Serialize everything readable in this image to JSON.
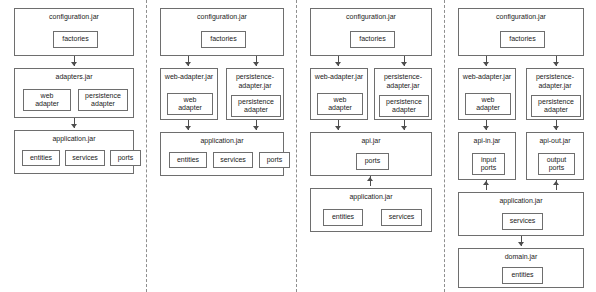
{
  "diagram": {
    "background_color": "#ffffff",
    "box_border_color": "#6e6e6e",
    "arrow_color": "#4d4d4d",
    "separator_color": "#8f8f8f",
    "separator_style": "dashed-vertical",
    "separator_count": 3
  },
  "columns": [
    {
      "id": "col-1",
      "name": "single-adapters-jar-variant",
      "jars": [
        {
          "id": "c1-configuration",
          "title": "configuration.jar",
          "components": [
            {
              "id": "c1-factories",
              "label": "factories"
            }
          ]
        },
        {
          "id": "c1-adapters",
          "title": "adapters.jar",
          "components": [
            {
              "id": "c1-web-adapter",
              "label": "web\nadapter"
            },
            {
              "id": "c1-persistence-adapter",
              "label": "persistence\nadapter"
            }
          ]
        },
        {
          "id": "c1-application",
          "title": "application.jar",
          "components": [
            {
              "id": "c1-entities",
              "label": "entities"
            },
            {
              "id": "c1-services",
              "label": "services"
            },
            {
              "id": "c1-ports",
              "label": "ports"
            }
          ]
        }
      ],
      "arrows": [
        {
          "id": "c1-a1",
          "from": "c1-configuration",
          "to": "c1-adapters",
          "direction": "down"
        },
        {
          "id": "c1-a2",
          "from": "c1-adapters",
          "to": "c1-application",
          "direction": "down"
        }
      ]
    },
    {
      "id": "col-2",
      "name": "split-adapter-jars-variant",
      "jars": [
        {
          "id": "c2-configuration",
          "title": "configuration.jar",
          "components": [
            {
              "id": "c2-factories",
              "label": "factories"
            }
          ]
        },
        {
          "id": "c2-web-adapter-jar",
          "title": "web-adapter.jar",
          "components": [
            {
              "id": "c2-web-adapter",
              "label": "web\nadapter"
            }
          ]
        },
        {
          "id": "c2-persistence-adapter-jar",
          "title": "persistence-\nadapter.jar",
          "components": [
            {
              "id": "c2-persistence-adapter",
              "label": "persistence\nadapter"
            }
          ]
        },
        {
          "id": "c2-application",
          "title": "application.jar",
          "components": [
            {
              "id": "c2-entities",
              "label": "entities"
            },
            {
              "id": "c2-services",
              "label": "services"
            },
            {
              "id": "c2-ports",
              "label": "ports"
            }
          ]
        }
      ],
      "arrows": [
        {
          "id": "c2-a1",
          "from": "c2-configuration",
          "to": "c2-web-adapter-jar",
          "direction": "down"
        },
        {
          "id": "c2-a2",
          "from": "c2-configuration",
          "to": "c2-persistence-adapter-jar",
          "direction": "down"
        },
        {
          "id": "c2-a3",
          "from": "c2-web-adapter-jar",
          "to": "c2-application",
          "direction": "down"
        },
        {
          "id": "c2-a4",
          "from": "c2-persistence-adapter-jar",
          "to": "c2-application",
          "direction": "down"
        }
      ]
    },
    {
      "id": "col-3",
      "name": "separate-api-jar-variant",
      "jars": [
        {
          "id": "c3-configuration",
          "title": "configuration.jar",
          "components": [
            {
              "id": "c3-factories",
              "label": "factories"
            }
          ]
        },
        {
          "id": "c3-web-adapter-jar",
          "title": "web-adapter.jar",
          "components": [
            {
              "id": "c3-web-adapter",
              "label": "web\nadapter"
            }
          ]
        },
        {
          "id": "c3-persistence-adapter-jar",
          "title": "persistence-\nadapter.jar",
          "components": [
            {
              "id": "c3-persistence-adapter",
              "label": "persistence\nadapter"
            }
          ]
        },
        {
          "id": "c3-api",
          "title": "api.jar",
          "components": [
            {
              "id": "c3-ports",
              "label": "ports"
            }
          ]
        },
        {
          "id": "c3-application",
          "title": "application.jar",
          "components": [
            {
              "id": "c3-entities",
              "label": "entities"
            },
            {
              "id": "c3-services",
              "label": "services"
            }
          ]
        }
      ],
      "arrows": [
        {
          "id": "c3-a1",
          "from": "c3-configuration",
          "to": "c3-web-adapter-jar",
          "direction": "down"
        },
        {
          "id": "c3-a2",
          "from": "c3-configuration",
          "to": "c3-persistence-adapter-jar",
          "direction": "down"
        },
        {
          "id": "c3-a3",
          "from": "c3-web-adapter-jar",
          "to": "c3-api",
          "direction": "down"
        },
        {
          "id": "c3-a4",
          "from": "c3-persistence-adapter-jar",
          "to": "c3-api",
          "direction": "down"
        },
        {
          "id": "c3-a5",
          "from": "c3-application",
          "to": "c3-api",
          "direction": "up"
        }
      ]
    },
    {
      "id": "col-4",
      "name": "in-out-api-and-domain-jars-variant",
      "jars": [
        {
          "id": "c4-configuration",
          "title": "configuration.jar",
          "components": [
            {
              "id": "c4-factories",
              "label": "factories"
            }
          ]
        },
        {
          "id": "c4-web-adapter-jar",
          "title": "web-adapter.jar",
          "components": [
            {
              "id": "c4-web-adapter",
              "label": "web\nadapter"
            }
          ]
        },
        {
          "id": "c4-persistence-adapter-jar",
          "title": "persistence-\nadapter.jar",
          "components": [
            {
              "id": "c4-persistence-adapter",
              "label": "persistence\nadapter"
            }
          ]
        },
        {
          "id": "c4-api-in",
          "title": "api-in.jar",
          "components": [
            {
              "id": "c4-input-ports",
              "label": "input\nports"
            }
          ]
        },
        {
          "id": "c4-api-out",
          "title": "api-out.jar",
          "components": [
            {
              "id": "c4-output-ports",
              "label": "output\nports"
            }
          ]
        },
        {
          "id": "c4-application",
          "title": "application.jar",
          "components": [
            {
              "id": "c4-services",
              "label": "services"
            }
          ]
        },
        {
          "id": "c4-domain",
          "title": "domain.jar",
          "components": [
            {
              "id": "c4-entities",
              "label": "entities"
            }
          ]
        }
      ],
      "arrows": [
        {
          "id": "c4-a1",
          "from": "c4-configuration",
          "to": "c4-web-adapter-jar",
          "direction": "down"
        },
        {
          "id": "c4-a2",
          "from": "c4-configuration",
          "to": "c4-persistence-adapter-jar",
          "direction": "down"
        },
        {
          "id": "c4-a3",
          "from": "c4-web-adapter-jar",
          "to": "c4-api-in",
          "direction": "down"
        },
        {
          "id": "c4-a4",
          "from": "c4-persistence-adapter-jar",
          "to": "c4-api-out",
          "direction": "down"
        },
        {
          "id": "c4-a5",
          "from": "c4-application",
          "to": "c4-api-in",
          "direction": "up"
        },
        {
          "id": "c4-a6",
          "from": "c4-application",
          "to": "c4-api-out",
          "direction": "up"
        },
        {
          "id": "c4-a7",
          "from": "c4-application",
          "to": "c4-domain",
          "direction": "down"
        }
      ]
    }
  ]
}
